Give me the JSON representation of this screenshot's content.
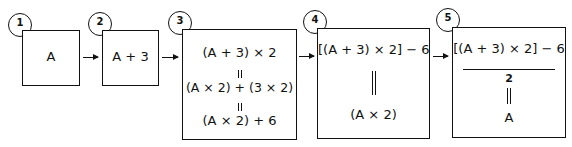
{
  "steps": [
    {
      "number": "1",
      "lines": [
        "A"
      ]
    },
    {
      "number": "2",
      "lines": [
        "A + 3"
      ]
    },
    {
      "number": "3",
      "lines": [
        "(A + 3) × 2",
        "(A × 2) + (3 × 2)",
        "(A × 2) + 6"
      ]
    },
    {
      "number": "4",
      "lines": [
        "[(A + 3) × 2] − 6",
        "(A × 2)"
      ]
    },
    {
      "number": "5",
      "numerator": "[(A + 3) × 2] − 6",
      "denominator": "2",
      "result": "A"
    }
  ],
  "colors": {
    "stroke": "#111111",
    "background": "#ffffff"
  }
}
